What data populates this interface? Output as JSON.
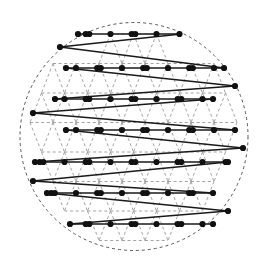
{
  "figure": {
    "type": "diagram",
    "canvas": {
      "width": 268,
      "height": 273,
      "background": "#ffffff"
    },
    "colors": {
      "boundary": "#555555",
      "lattice_edge": "#999999",
      "path_edge": "#1a1a1a",
      "node_fill": "#111111"
    },
    "boundary": {
      "shape": "circle",
      "cx": 134.0,
      "cy": 136.5,
      "r": 114.0,
      "stroke_width": 1.0,
      "dash": "3,3",
      "label": "disk-boundary"
    },
    "lattice": {
      "kind": "triangular",
      "x_spacing": 23.0,
      "y_spacing": 29.5,
      "row_offset_x": 11.5,
      "origin_x": 18.5,
      "origin_y": 34.0,
      "rows": 8,
      "cols": 11,
      "edge_stroke_width": 0.9,
      "edge_dash": "3,2.6"
    },
    "nodes": {
      "radius": 3.1,
      "pair_offset": 3.6,
      "comment": "each visited lattice site is drawn as a close pair of filled dots where two path segments meet"
    },
    "path": {
      "style": "boustrophedon",
      "stroke_width": 1.7,
      "rows": [
        {
          "index": 0,
          "y": 34.0,
          "x_start": 78.0,
          "x_end": 181.0,
          "direction": "ltr"
        },
        {
          "index": 1,
          "y": 68.0,
          "x_start": 66.0,
          "x_end": 224.0,
          "direction": "rtl"
        },
        {
          "index": 2,
          "y": 99.0,
          "x_start": 55.0,
          "x_end": 213.0,
          "direction": "ltr"
        },
        {
          "index": 3,
          "y": 130.0,
          "x_start": 66.0,
          "x_end": 235.0,
          "direction": "rtl"
        },
        {
          "index": 4,
          "y": 162.0,
          "x_start": 35.0,
          "x_end": 228.0,
          "direction": "ltr"
        },
        {
          "index": 5,
          "y": 193.0,
          "x_start": 47.0,
          "x_end": 213.0,
          "direction": "rtl"
        },
        {
          "index": 6,
          "y": 224.0,
          "x_start": 70.0,
          "x_end": 213.0,
          "direction": "ltr"
        }
      ],
      "turns": [
        {
          "side": "left",
          "from_row": 0,
          "to_row": 1,
          "via_x": 60.0,
          "via_y": 47.0
        },
        {
          "side": "right",
          "from_row": 1,
          "to_row": 2,
          "via_x": 235.0,
          "via_y": 86.0
        },
        {
          "side": "left",
          "from_row": 2,
          "to_row": 3,
          "via_x": 33.0,
          "via_y": 113.0
        },
        {
          "side": "right",
          "from_row": 3,
          "to_row": 4,
          "via_x": 243.0,
          "via_y": 148.0
        },
        {
          "side": "left",
          "from_row": 4,
          "to_row": 5,
          "via_x": 33.0,
          "via_y": 181.0
        },
        {
          "side": "right",
          "from_row": 5,
          "to_row": 6,
          "via_x": 228.0,
          "via_y": 211.0
        }
      ]
    },
    "annotations": []
  }
}
